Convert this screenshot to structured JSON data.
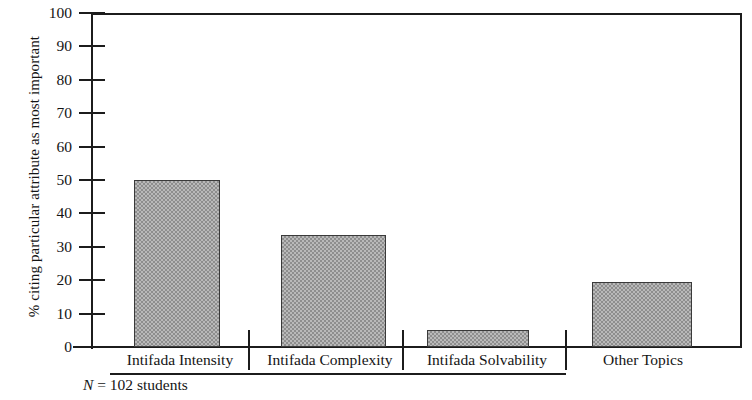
{
  "chart_data": {
    "type": "bar",
    "title": "",
    "subtitle": "",
    "xlabel": "",
    "ylabel": "% citing particular attribute as most important",
    "categories": [
      "Intifada Intensity",
      "Intifada Complexity",
      "Intifada Solvability",
      "Other Topics"
    ],
    "values": [
      50,
      33.5,
      5,
      19.5
    ],
    "ylim": [
      0,
      100
    ],
    "ytick_labels": [
      "0",
      "10",
      "20",
      "30",
      "40",
      "50",
      "60",
      "70",
      "80",
      "90",
      "100"
    ],
    "ytick_values": [
      0,
      10,
      20,
      30,
      40,
      50,
      60,
      70,
      80,
      90,
      100
    ],
    "grid": false,
    "legend": null,
    "annotations": [
      {
        "name": "sample-size-note",
        "text_symbol": "N",
        "text_rest": " = 102 students"
      }
    ],
    "group_underline_categories": [
      "Intifada Intensity",
      "Intifada Complexity",
      "Intifada Solvability"
    ],
    "bar_fill_color": "#b9b9b9",
    "bar_edge_color": "#3a3a3a",
    "axis_color": "#1c1c1c"
  },
  "footnote": {
    "symbol": "N",
    "text": " = 102 students"
  }
}
